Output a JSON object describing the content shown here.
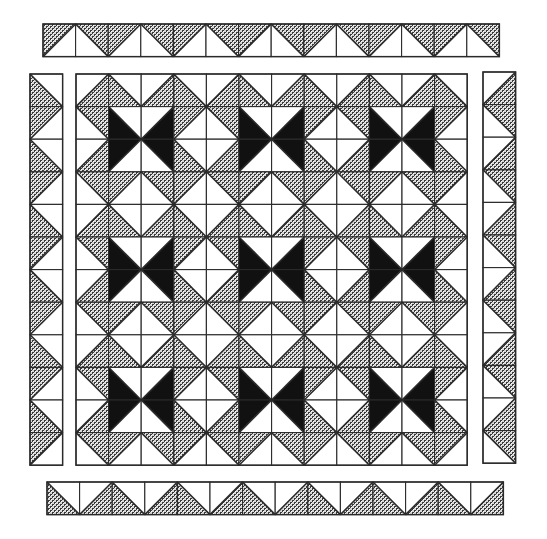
{
  "diagram": {
    "colors": {
      "background": "#ffffff",
      "line": "#2a2a2a",
      "shaded_dark": "#3a3a3a",
      "shaded_light": "#d8d8d8",
      "black": "#111111",
      "white": "#ffffff"
    },
    "legend_fills": {
      "W": "white",
      "S": "shaded (checkered gray print)",
      "B": "solid black"
    },
    "main_grid": {
      "x": 76,
      "y": 74,
      "cell": 32.6,
      "cols": 12,
      "rows": 12,
      "tile_size": 4,
      "tile": [
        [
          [
            "/",
            "W",
            "S"
          ],
          [
            "\\",
            "W",
            "S"
          ],
          [
            "/",
            "W",
            "S"
          ],
          [
            "\\",
            "W",
            "S"
          ]
        ],
        [
          [
            "\\",
            "S",
            "W"
          ],
          [
            "\\",
            "W",
            "B"
          ],
          [
            "/",
            "W",
            "B"
          ],
          [
            "/",
            "S",
            "W"
          ]
        ],
        [
          [
            "/",
            "W",
            "S"
          ],
          [
            "/",
            "B",
            "W"
          ],
          [
            "\\",
            "B",
            "W"
          ],
          [
            "\\",
            "W",
            "S"
          ]
        ],
        [
          [
            "\\",
            "S",
            "W"
          ],
          [
            "/",
            "S",
            "W"
          ],
          [
            "\\",
            "S",
            "W"
          ],
          [
            "/",
            "S",
            "W"
          ]
        ]
      ],
      "bowtie_blocks": 9
    },
    "borders": [
      {
        "name": "top-border",
        "x": 43,
        "y": 24,
        "cell": 32.6,
        "count": 14,
        "orientation": "horizontal",
        "tile": [
          [
            "/",
            "S",
            "W"
          ],
          [
            "\\",
            "S",
            "W"
          ]
        ]
      },
      {
        "name": "bottom-border",
        "x": 47,
        "y": 482,
        "cell": 32.6,
        "count": 14,
        "orientation": "horizontal",
        "tile": [
          [
            "\\",
            "W",
            "S"
          ],
          [
            "/",
            "W",
            "S"
          ]
        ]
      },
      {
        "name": "left-border",
        "x": 30,
        "y": 74,
        "cell": 32.6,
        "count": 12,
        "orientation": "vertical",
        "tile": [
          [
            "\\",
            "W",
            "S"
          ],
          [
            "/",
            "S",
            "W"
          ]
        ]
      },
      {
        "name": "right-border",
        "x": 483,
        "y": 72,
        "cell": 32.6,
        "count": 12,
        "orientation": "vertical",
        "tile": [
          [
            "/",
            "W",
            "S"
          ],
          [
            "\\",
            "S",
            "W"
          ]
        ]
      }
    ]
  }
}
